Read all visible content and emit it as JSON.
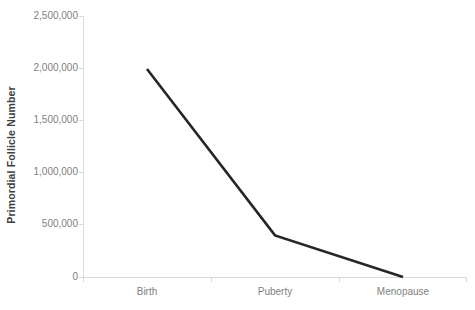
{
  "chart_data": {
    "type": "line",
    "title": "",
    "subtitle": "",
    "xlabel": "",
    "ylabel": "Primordial Follicle Number",
    "categories": [
      "Birth",
      "Puberty",
      "Menopause"
    ],
    "values": [
      2000000,
      400000,
      0
    ],
    "series": [
      {
        "name": "Primordial Follicle Number",
        "values": [
          2000000,
          400000,
          0
        ]
      }
    ],
    "ylim": [
      0,
      2500000
    ],
    "ytick_labels": [
      "2,500,000",
      "2,000,000",
      "1,500,000",
      "1,000,000",
      "500,000",
      "0"
    ],
    "ytick_values": [
      2500000,
      2000000,
      1500000,
      1000000,
      500000,
      0
    ],
    "grid": false,
    "legend": false,
    "legend_position": "none",
    "line_color": "#262626",
    "axis_color": "#d9d9d9",
    "tick_label_color": "#808080",
    "axis_title_color": "#404040",
    "background_color": "#ffffff"
  }
}
